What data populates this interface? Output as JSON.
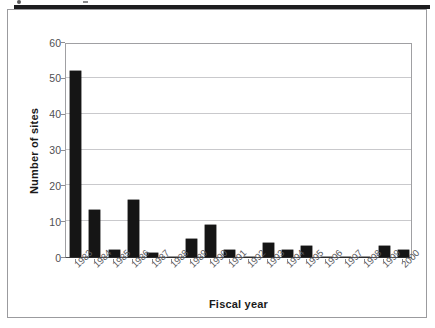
{
  "figure": {
    "background_color": "#ffffff",
    "frame_color": "#9b9b9e",
    "scan_band_color": "#1d1d1f"
  },
  "chart_data": {
    "type": "bar",
    "title": "",
    "xlabel": "Fiscal year",
    "ylabel": "Number of sites",
    "categories": [
      "1983",
      "1984",
      "1985",
      "1986",
      "1987",
      "1988",
      "1989",
      "1990",
      "1991",
      "1992",
      "1993",
      "1994",
      "1995",
      "1996",
      "1997",
      "1998",
      "1999",
      "2000"
    ],
    "values": [
      52,
      13,
      2,
      16,
      1,
      0,
      5,
      9,
      2,
      0,
      4,
      2,
      3,
      0,
      0,
      0,
      3,
      2
    ],
    "ylim": [
      0,
      60
    ],
    "ytick_labels": [
      "60",
      "50",
      "40",
      "30",
      "20",
      "10",
      "0"
    ],
    "ytick_values": [
      60,
      50,
      40,
      30,
      20,
      10,
      0
    ],
    "ytick_step": 10,
    "grid": "horizontal",
    "legend": "none",
    "bar_color": "#151515",
    "gridline_color": "#c9c9cc",
    "xtick_label_rotation": -45
  }
}
